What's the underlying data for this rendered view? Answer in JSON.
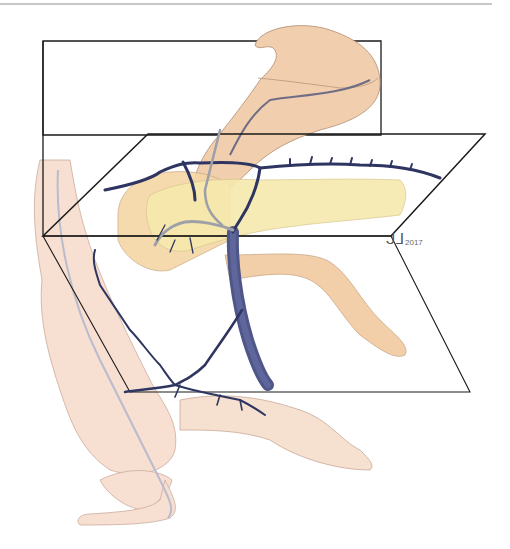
{
  "illustration": {
    "subject": "Anatomical illustration: stomach, pancreas, duodenum, colon and mesenteric vessels with two transparent planes",
    "colors": {
      "tissue": "#f3d6b8",
      "tissue_outline": "#b8967a",
      "pancreas": "#f6e7a6",
      "vein": "#4f5688",
      "vein_dark": "#2e3560",
      "plane_outline": "#1a1a1a",
      "background": "#ffffff"
    }
  },
  "signature": {
    "initials": "ᒍᒧ",
    "year": "2017"
  }
}
